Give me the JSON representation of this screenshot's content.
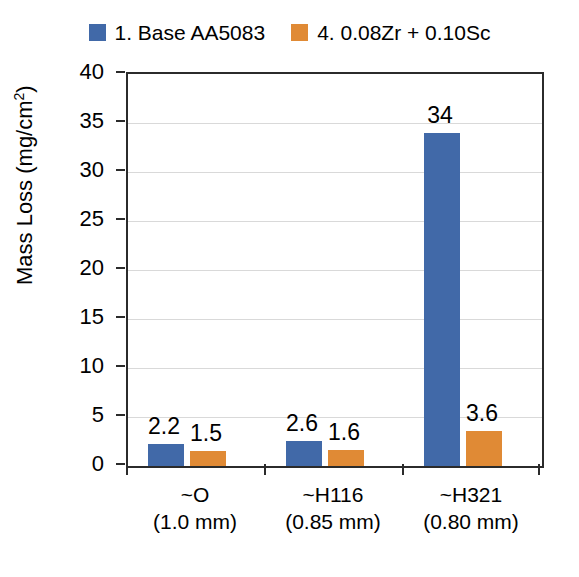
{
  "chart_data": {
    "type": "bar",
    "title": "",
    "xlabel": "",
    "ylabel": "Mass Loss (mg/cm2)",
    "ylabel_base": "Mass Loss (mg/cm",
    "ylabel_sup": "2",
    "ylabel_tail": ")",
    "ylim": [
      0,
      40
    ],
    "ytick_step": 5,
    "yticks": [
      "40",
      "35",
      "30",
      "25",
      "20",
      "15",
      "10",
      "5",
      "0"
    ],
    "ytick_values": [
      40,
      35,
      30,
      25,
      20,
      15,
      10,
      5,
      0
    ],
    "grid": true,
    "grid_axis": "y",
    "legend_position": "top-center",
    "categories": [
      "~O",
      "~H116",
      "~H321"
    ],
    "category_sublabels": [
      "(1.0 mm)",
      "(0.85 mm)",
      "(0.80 mm)"
    ],
    "series": [
      {
        "name": "1. Base AA5083",
        "color": "#4169a8",
        "values": [
          2.2,
          2.6,
          34
        ],
        "labels": [
          "2.2",
          "2.6",
          "34"
        ]
      },
      {
        "name": "4. 0.08Zr + 0.10Sc",
        "color": "#e08a35",
        "values": [
          1.5,
          1.6,
          3.6
        ],
        "labels": [
          "1.5",
          "1.6",
          "3.6"
        ]
      }
    ]
  },
  "legend": {
    "entries": [
      {
        "label": "1. Base AA5083",
        "color": "#4169a8"
      },
      {
        "label": "4. 0.08Zr + 0.10Sc",
        "color": "#e08a35"
      }
    ]
  },
  "colors": {
    "series_blue": "#4169a8",
    "series_orange": "#e08a35",
    "axis": "#2b2b2b",
    "gridline": "#d9d9d9",
    "background": "#ffffff",
    "text": "#000000"
  }
}
